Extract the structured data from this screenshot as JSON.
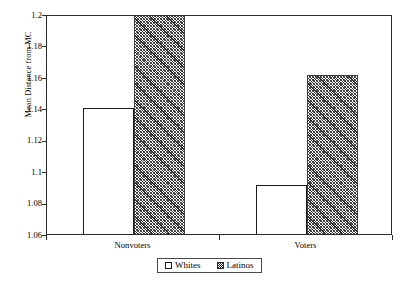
{
  "chart_data": {
    "type": "bar",
    "title": "",
    "xlabel": "",
    "ylabel": "Mean Distance from MC",
    "categories": [
      "Nonvoters",
      "Voters"
    ],
    "series": [
      {
        "name": "Whites",
        "values": [
          1.14,
          1.091
        ]
      },
      {
        "name": "Latinos",
        "values": [
          1.2,
          1.161
        ]
      }
    ],
    "ylim": [
      1.06,
      1.2
    ],
    "ytick_labels": [
      "1.06",
      "1.08",
      "1.1",
      "1.12",
      "1.14",
      "1.16",
      "1.18",
      "1.2"
    ],
    "ytick_values": [
      1.06,
      1.08,
      1.1,
      1.12,
      1.14,
      1.16,
      1.18,
      1.2
    ],
    "grid": false,
    "legend_position": "bottom"
  },
  "legend": {
    "entries": [
      {
        "label": "Whites",
        "swatch": "white-square-swatch"
      },
      {
        "label": "Latinos",
        "swatch": "hatched-square-swatch"
      }
    ]
  }
}
